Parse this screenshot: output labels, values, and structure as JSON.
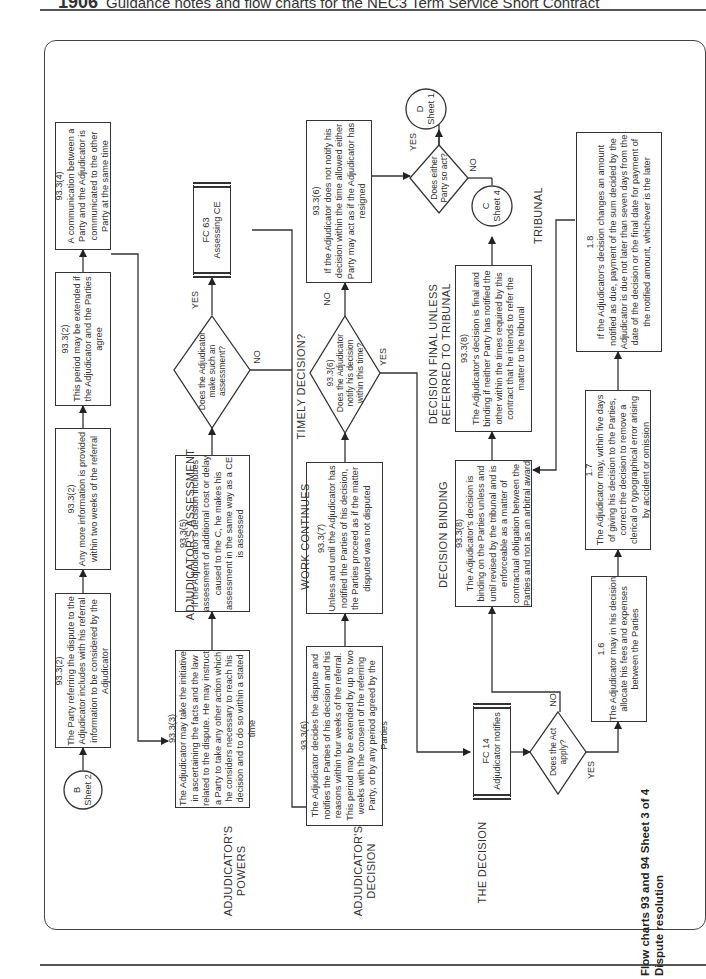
{
  "header": {
    "chapter": "1906",
    "title": "Guidance notes and flow charts for the NEC3 Term Service Short Contract"
  },
  "footer_title": {
    "line1": "Flow charts 93 and 94 Sheet 3 of 4",
    "line2": "Dispute resolution"
  },
  "sections": {
    "powers": "ADJUDICATOR'S POWERS",
    "assessment": "ADJUDICATOR'S ASSESSMENT",
    "decision": "ADJUDICATOR'S DECISION",
    "work": "WORK CONTINUES",
    "timely": "TIMELY DECISION?",
    "the_decision": "THE DECISION",
    "binding": "DECISION BINDING",
    "final": "DECISION FINAL UNLESS REFERRED TO TRIBUNAL",
    "tribunal": "TRIBUNAL"
  },
  "connectors": {
    "b": {
      "letter": "B",
      "sheet": "Sheet 2"
    },
    "c": {
      "letter": "C",
      "sheet": "Sheet 4"
    },
    "d": {
      "letter": "D",
      "sheet": "Sheet 1"
    }
  },
  "boxes": {
    "referral": {
      "ref": "93.3(2)",
      "text": "The Party referring the dispute to the Adjudicator includes with his referral information to be considered by the Adjudicator"
    },
    "more_info": {
      "ref": "93.3(2)",
      "text": "Any more information is provided within two weeks of the referral"
    },
    "extended": {
      "ref": "93.3(2)",
      "text": "This period may be extended if the Adjudicator and the Parties agree"
    },
    "communication": {
      "ref": "93.3(4)",
      "text": "A communication between a Party and the Adjudicator is communicated to the other Party at the same time"
    },
    "powers": {
      "ref": "93.3(3)",
      "text": "The Adjudicator may take the initiative in ascertaining the facts and the law related to the dispute. He may instruct a Party to take any other action which he considers necessary to reach his decision and to do so within a stated time"
    },
    "assessment": {
      "ref": "93.3(5)",
      "text": "If the Adjudicator's decision includes assessment of additional cost or delay caused to the C, he makes his assessment in the same way as a CE is assessed"
    },
    "fc63": {
      "ref": "FC 63",
      "text": "Assessing CE"
    },
    "decides": {
      "ref": "93.3(6)",
      "text": "The Adjudicator decides the dispute and notifies the Parties of his decision and his reasons within four weeks of the referral. This period may be extended by up to two weeks with the consent of the referring Party, or by any period agreed by the Parties"
    },
    "work_continues": {
      "ref": "93.3(7)",
      "text": "Unless and until the Adjudicator has notified the Parties of his decision, the Parties proceed as if the matter disputed was not disputed"
    },
    "not_notify": {
      "ref": "93.3(6)",
      "text": "If the Adjudicator does not notify his decision within the time allowed either Party may act as if the Adjudicator has resigned"
    },
    "fc14": {
      "ref": "FC 14",
      "text": "Adjudicator notifies"
    },
    "binding": {
      "ref": "93.3(8)",
      "text": "The Adjudicator's decision is binding on the Parties unless and until revised by the tribunal and is enforceable as a matter of contractual obligation between the Parties and not as an arbitral award"
    },
    "final": {
      "ref": "93.3(8)",
      "text": "The Adjudicator's decision is final and binding if neither Party has notified the other within the times required by this contract that he intends to refer the matter to the tribunal"
    },
    "fees": {
      "ref": "1.6",
      "text": "The Adjudicator may in his decision allocate his fees and expenses between the Parties"
    },
    "correct": {
      "ref": "1.7",
      "text": "The Adjudicator may, within five days of giving his decision to the Parties, correct the decision to remove a clerical or typographical error arising by accident or omission"
    },
    "payment": {
      "ref": "1.8",
      "text": "If the Adjudicator's decision changes an amount notified as due, payment of the sum decided by the Adjudicator is due not later than seven days from the date of the decision or the final date for payment of the notified amount, whichever is the later"
    }
  },
  "decisions": {
    "assessment_q": {
      "text": "Does the Adjudicator make such an assessment?",
      "yes": "YES",
      "no": "NO"
    },
    "timely_q": {
      "ref": "93.3(6)",
      "text": "Does the Adjudicator notify his decision within this time?",
      "yes": "YES",
      "no": "NO"
    },
    "act_q": {
      "text": "Does the Act apply?",
      "yes": "YES",
      "no": "NO"
    },
    "either_q": {
      "text": "Does either Party so act?",
      "yes": "YES",
      "no": "NO"
    }
  }
}
